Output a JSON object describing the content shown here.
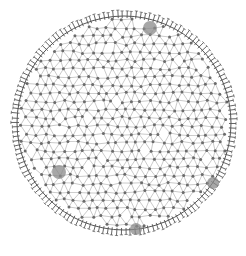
{
  "image": {
    "subject": "circular radiolarian-like organism with a mesh of interconnected nodes and a spiny rim",
    "background_color": "#ffffff",
    "line_color": "#7a7a7a",
    "node_color": "#6b6b6b",
    "rim_color": "#555555",
    "blob_color": "#8a8a8a",
    "blobs": [
      {
        "name": "top-right-blob"
      },
      {
        "name": "left-lower-blob"
      },
      {
        "name": "right-lower-blob"
      },
      {
        "name": "bottom-blob"
      }
    ]
  }
}
